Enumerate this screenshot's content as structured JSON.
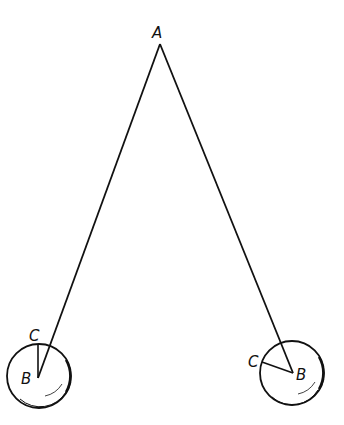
{
  "diagram": {
    "labels": {
      "apex": "A",
      "left_center": "B",
      "left_radius_end": "C",
      "right_center": "B",
      "right_radius_end": "C"
    },
    "colors": {
      "ink": "#111111",
      "background": "#ffffff"
    }
  }
}
